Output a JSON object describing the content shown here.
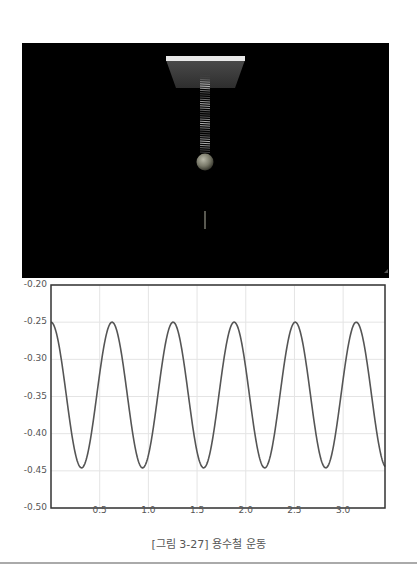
{
  "scene": {
    "description": "3D spring-mass simulation",
    "background": "#000000",
    "ceiling_color": "#e8e8e8",
    "ceiling_plate_color": "#3a3a3a",
    "spring_color": "#9a9a9a",
    "mass_color": "#8a8a7a",
    "trail_color": "#b0b0a0"
  },
  "chart_data": {
    "type": "line",
    "title": "",
    "xlabel": "",
    "ylabel": "",
    "xlim": [
      0,
      3.43
    ],
    "ylim": [
      -0.5,
      -0.2
    ],
    "x_ticks": [
      "0.5",
      "1.0",
      "1.5",
      "2.0",
      "2.5",
      "3.0"
    ],
    "y_ticks": [
      "-0.20",
      "-0.25",
      "-0.30",
      "-0.35",
      "-0.40",
      "-0.45",
      "-0.50"
    ],
    "grid": true,
    "legend": null,
    "series": [
      {
        "name": "position",
        "color": "#555555",
        "function": "y = -0.348 + 0.098*cos(2*pi*t/0.627)",
        "period": 0.627,
        "max": -0.25,
        "min": -0.446,
        "x": [
          0,
          0.157,
          0.314,
          0.47,
          0.627,
          0.784,
          0.941,
          1.097,
          1.254,
          1.411,
          1.568,
          1.724,
          1.881,
          2.038,
          2.195,
          2.351,
          2.508,
          2.665,
          2.822,
          2.978,
          3.135,
          3.292,
          3.43
        ],
        "y": [
          -0.25,
          -0.348,
          -0.446,
          -0.348,
          -0.25,
          -0.348,
          -0.446,
          -0.348,
          -0.25,
          -0.348,
          -0.446,
          -0.348,
          -0.25,
          -0.348,
          -0.446,
          -0.348,
          -0.25,
          -0.348,
          -0.446,
          -0.348,
          -0.25,
          -0.348,
          -0.44
        ]
      }
    ]
  },
  "caption": "[그림 3-27] 용수철 운동"
}
